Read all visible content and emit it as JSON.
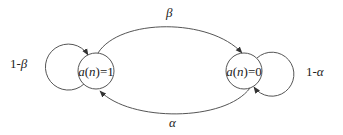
{
  "diagram": {
    "type": "state-transition",
    "nodes": [
      {
        "id": "s1",
        "label_var": "a",
        "label_arg": "n",
        "label_value": "=1"
      },
      {
        "id": "s0",
        "label_var": "a",
        "label_arg": "n",
        "label_value": "=0"
      }
    ],
    "edges": [
      {
        "from": "s1",
        "to": "s0",
        "label": "β"
      },
      {
        "from": "s0",
        "to": "s1",
        "label": "α"
      },
      {
        "from": "s1",
        "to": "s1",
        "label_prefix": "1-",
        "label_symbol": "β"
      },
      {
        "from": "s0",
        "to": "s0",
        "label_prefix": "1-",
        "label_symbol": "α"
      }
    ]
  }
}
